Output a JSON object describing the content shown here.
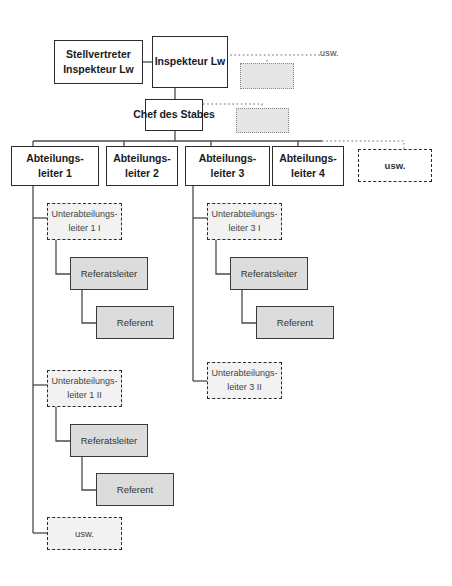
{
  "diagram": {
    "colors": {
      "box_fill_white": "#ffffff",
      "box_fill_gray": "#dcdcdc",
      "box_fill_dotted": "#e6e6e6",
      "border_dark": "#2b2b2b",
      "line": "#4a4a4a",
      "line_dotted": "#9a9a9a"
    },
    "nodes": {
      "deputy": {
        "line1": "Stellvertreter",
        "line2": "Inspekteur Lw"
      },
      "inspector": {
        "line1": "Inspekteur Lw"
      },
      "chief_of_staff": {
        "line1": "Chef des Stabes"
      },
      "dept1": {
        "line1": "Abteilungs-",
        "line2": "leiter 1"
      },
      "dept2": {
        "line1": "Abteilungs-",
        "line2": "leiter 2"
      },
      "dept3": {
        "line1": "Abteilungs-",
        "line2": "leiter 3"
      },
      "dept4": {
        "line1": "Abteilungs-",
        "line2": "leiter 4"
      },
      "dept_more": {
        "line1": "usw."
      },
      "sub1_1": {
        "line1": "Unterabteilungs-",
        "line2": "leiter 1 I"
      },
      "sub1_2": {
        "line1": "Unterabteilungs-",
        "line2": "leiter 1 II"
      },
      "sub3_1": {
        "line1": "Unterabteilungs-",
        "line2": "leiter 3 I"
      },
      "sub3_2": {
        "line1": "Unterabteilungs-",
        "line2": "leiter 3 II"
      },
      "ref_lead_1": {
        "line1": "Referatsleiter"
      },
      "ref_1": {
        "line1": "Referent"
      },
      "ref_lead_2": {
        "line1": "Referatsleiter"
      },
      "ref_2": {
        "line1": "Referent"
      },
      "ref_lead_3": {
        "line1": "Referatsleiter"
      },
      "ref_3": {
        "line1": "Referent"
      },
      "bottom_more": {
        "line1": "usw."
      },
      "placeholder_inspector": {
        "line1": ""
      },
      "placeholder_chief": {
        "line1": ""
      }
    },
    "labels": {
      "usw_top": "usw."
    }
  }
}
